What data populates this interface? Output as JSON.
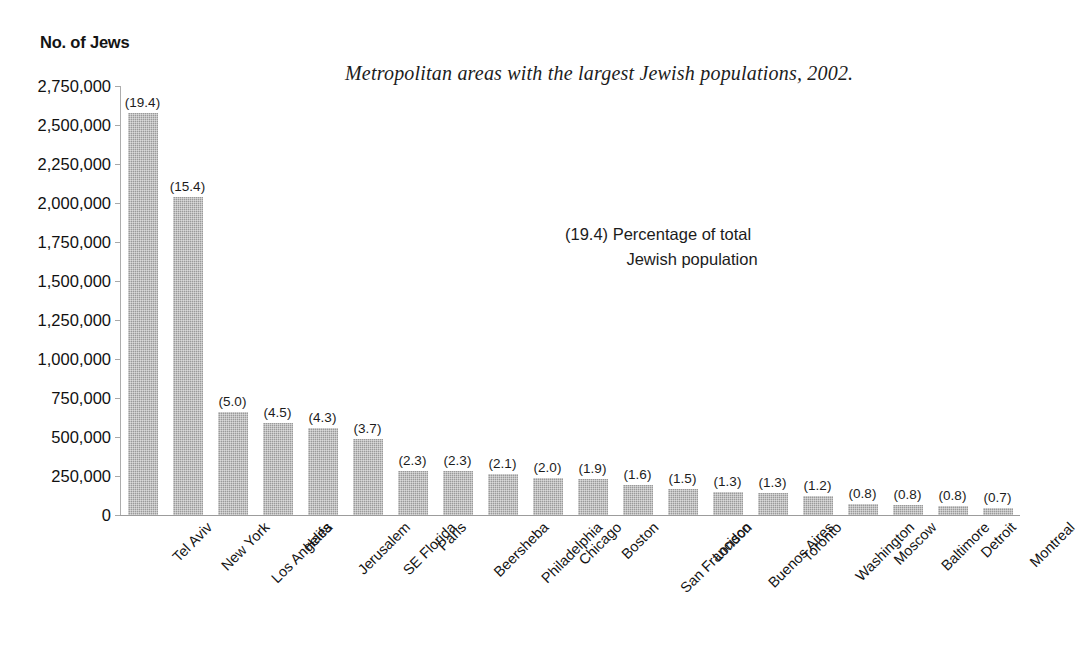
{
  "y_axis_title": "No. of Jews",
  "figure_title": "Metropolitan areas with the largest Jewish populations, 2002.",
  "note": {
    "line1": "(19.4) Percentage of total",
    "line2": "Jewish population"
  },
  "colors": {
    "bar_fill": "#9a9a9a",
    "axis": "#a8a8a8",
    "text": "#1a1a1a"
  },
  "chart_data": {
    "type": "bar",
    "title": "Metropolitan areas with the largest Jewish populations, 2002.",
    "xlabel": "",
    "ylabel": "No. of Jews",
    "ylim": [
      0,
      2750000
    ],
    "grid": false,
    "legend": "none",
    "ytick_labels": [
      "2,750,000",
      "2,500,000",
      "2,250,000",
      "2,000,000",
      "1,750,000",
      "1,500,000",
      "1,250,000",
      "1,000,000",
      "750,000",
      "500,000",
      "250,000",
      "0"
    ],
    "ytick_values": [
      2750000,
      2500000,
      2250000,
      2000000,
      1750000,
      1500000,
      1250000,
      1000000,
      750000,
      500000,
      250000,
      0
    ],
    "categories": [
      "Tel Aviv",
      "New York",
      "Los Angeles",
      "Haifa",
      "Jerusalem",
      "SE Florida",
      "Paris",
      "Beersheba",
      "Philadelphia",
      "Chicago",
      "Boston",
      "San Francisco",
      "London",
      "Buenos Aires",
      "Toronto",
      "Washington",
      "Moscow",
      "Baltimore",
      "Detroit",
      "Montreal"
    ],
    "values": [
      2580000,
      2040000,
      660000,
      590000,
      560000,
      485000,
      285000,
      285000,
      260000,
      240000,
      230000,
      195000,
      165000,
      145000,
      140000,
      120000,
      70000,
      65000,
      60000,
      45000
    ],
    "data_labels": [
      "(19.4)",
      "(15.4)",
      "(5.0)",
      "(4.5)",
      "(4.3)",
      "(3.7)",
      "(2.3)",
      "(2.3)",
      "(2.1)",
      "(2.0)",
      "(1.9)",
      "(1.6)",
      "(1.5)",
      "(1.3)",
      "(1.3)",
      "(1.2)",
      "(0.8)",
      "(0.8)",
      "(0.8)",
      "(0.7)"
    ],
    "data_label_meaning": "Percentage of total Jewish population",
    "annotations": [
      "(19.4) Percentage of total Jewish population"
    ]
  }
}
